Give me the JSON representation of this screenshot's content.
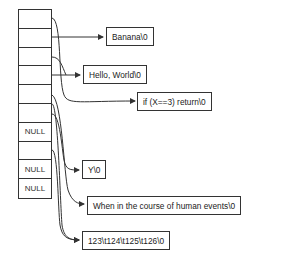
{
  "diagram": {
    "type": "array-of-string-pointers",
    "array": {
      "cells": [
        {
          "index": 0,
          "label": "",
          "points_to": "s_if"
        },
        {
          "index": 1,
          "label": "",
          "points_to": "s_banana"
        },
        {
          "index": 2,
          "label": "",
          "points_to": "s_hello"
        },
        {
          "index": 3,
          "label": "",
          "points_to": "s_y"
        },
        {
          "index": 4,
          "label": "",
          "points_to": "s_when"
        },
        {
          "index": 5,
          "label": "",
          "points_to": "s_num"
        },
        {
          "index": 6,
          "label": "NULL",
          "points_to": null
        },
        {
          "index": 7,
          "label": "",
          "points_to": "s_num"
        },
        {
          "index": 8,
          "label": "NULL",
          "points_to": null
        },
        {
          "index": 9,
          "label": "NULL",
          "points_to": null
        }
      ]
    },
    "strings": {
      "s_banana": "Banana\\0",
      "s_hello": "Hello, World\\0",
      "s_if": "if (X==3) return\\0",
      "s_y": "Y\\0",
      "s_when": "When in the course of human events\\0",
      "s_num": "123\\t124\\t125\\t126\\0"
    },
    "colors": {
      "stroke": "#333333",
      "text": "#222222",
      "background": "#ffffff"
    }
  }
}
